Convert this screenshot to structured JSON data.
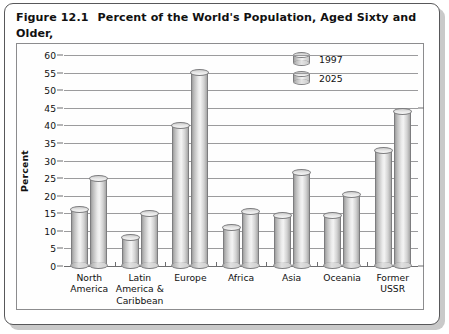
{
  "figure": {
    "number": "Figure 12.1",
    "title_line1": "Percent of the World's Population, Aged Sixty and Older,",
    "title_line2": "by Region, 1997–2025"
  },
  "chart_data": {
    "type": "bar",
    "title": "Percent of the World's Population, Aged Sixty and Older, by Region, 1997–2025",
    "subtitle": "",
    "xlabel": "",
    "ylabel": "Percent",
    "ylim": [
      0,
      60
    ],
    "yticks": [
      0,
      5,
      10,
      15,
      20,
      25,
      30,
      35,
      40,
      45,
      50,
      55,
      60
    ],
    "grid": true,
    "legend_position": "top-right",
    "style": "3d-cylinder",
    "categories": [
      "North America",
      "Latin America & Caribbean",
      "Europe",
      "Africa",
      "Asia",
      "Oceania",
      "Former USSR"
    ],
    "category_lines": [
      [
        "North",
        "America"
      ],
      [
        "Latin",
        "America &",
        "Caribbean"
      ],
      [
        "Europe"
      ],
      [
        "Africa"
      ],
      [
        "Asia"
      ],
      [
        "Oceania"
      ],
      [
        "Former",
        "USSR"
      ]
    ],
    "series": [
      {
        "name": "1997",
        "values": [
          16,
          8,
          40,
          11,
          14.5,
          14.5,
          33
        ]
      },
      {
        "name": "2025",
        "values": [
          25,
          15,
          55,
          15.5,
          26.5,
          20.5,
          44
        ]
      }
    ]
  },
  "legend": {
    "entries": [
      {
        "label": "1997",
        "icon": "cylinder-swatch-icon"
      },
      {
        "label": "2025",
        "icon": "cylinder-swatch-icon"
      }
    ]
  },
  "colors": {
    "frame": "#58585a",
    "gridline": "#9b9b9d",
    "axis": "#6d6d6f",
    "bar_light": "#f4f4f4",
    "bar_mid": "#cfcfcf",
    "bar_dark": "#9d9d9d",
    "text": "#111111",
    "shadow": "#c9c9c9"
  }
}
